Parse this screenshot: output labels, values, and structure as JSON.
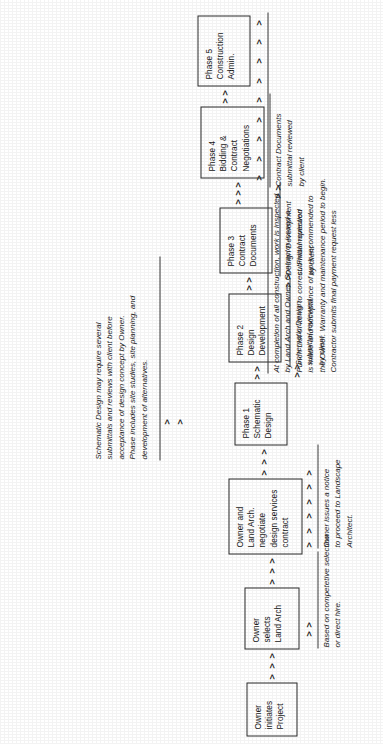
{
  "document": {
    "type": "process-flow-diagram",
    "subject": "Landscape Architecture Project Delivery Process",
    "orientation": "landscape content rotated 90 degrees counter-clockwise on a portrait page"
  },
  "boxes": [
    {
      "id": "owner-initiates",
      "lines": [
        "Owner",
        "initiates",
        "Project"
      ]
    },
    {
      "id": "owner-selects",
      "lines": [
        "Owner",
        "selects",
        "Land  Arch"
      ]
    },
    {
      "id": "negotiate",
      "lines": [
        "Owner and",
        "Land  Arch.",
        "negotiate",
        "design services",
        "contract"
      ]
    },
    {
      "id": "phase-1",
      "lines": [
        "Phase 1",
        "Schematic",
        "Design"
      ]
    },
    {
      "id": "phase-2",
      "lines": [
        "Phase 2",
        "Design",
        "Development"
      ]
    },
    {
      "id": "phase-3",
      "lines": [
        "Phase 3",
        "Contract",
        "Documents"
      ]
    },
    {
      "id": "phase-4",
      "lines": [
        "Phase 4",
        "Bidding &",
        "Contract",
        "Negotiations"
      ]
    },
    {
      "id": "phase-5",
      "lines": [
        "Phase 5",
        "Construction",
        "Admin."
      ]
    }
  ],
  "notes": {
    "schematic_detail": {
      "lines": [
        "Schematic Design may require several",
        "submittals and reviews with client before",
        "acceptance of design concept by Owner.",
        "Phase includes site studies, site planning, and",
        "development of alternatives."
      ]
    },
    "selection_basis": {
      "lines": [
        "Based on competetive selection",
        "or direct hire."
      ]
    },
    "notice_to_proceed": {
      "lines": [
        "Owner issues a notice",
        "to proceed to Landscape",
        "Architect."
      ]
    },
    "sd_review": {
      "lines": [
        "Schematic Design",
        "submittal reviewed",
        "by client"
      ]
    },
    "dd_review": {
      "lines": [
        "Design Development",
        "submittal reviewed",
        "by client"
      ]
    },
    "cd_review": {
      "lines": [
        "Contract Documents",
        "submittal reviewed",
        "by client"
      ]
    },
    "closeout": {
      "lines": [
        "At completion of all construction, work is inspected",
        "by Land  Arch  and Owner.  Contractor issued a",
        "Punch List of items to correct.  Final inspection",
        "is made and acceptance of work recommended to",
        "the Owner.  Warranty and maintenance period to begin.",
        "Contractor submits final payment request less"
      ]
    }
  },
  "arrows": {
    "glyph": ">",
    "runs": [
      {
        "id": "initiates-to-selects",
        "count": 3
      },
      {
        "id": "selects-to-negotiate",
        "count": 3
      },
      {
        "id": "negotiate-to-phase1",
        "count": 3
      },
      {
        "id": "phase1-to-phase2",
        "count": 2
      },
      {
        "id": "phase2-to-phase3",
        "count": 2
      },
      {
        "id": "phase3-to-phase4",
        "count": 3
      },
      {
        "id": "phase4-to-phase5",
        "count": 2
      },
      {
        "id": "selection-feedback",
        "count": 2
      },
      {
        "id": "notice-feedback",
        "count": 6
      },
      {
        "id": "sd-review-feedback",
        "count": 2
      },
      {
        "id": "dd-review-feedback",
        "count": 2
      },
      {
        "id": "cd-review-feedback",
        "count": 2
      },
      {
        "id": "closeout-feedback",
        "count": 9
      }
    ]
  },
  "colors": {
    "ink": "#1c1c1c",
    "box_border": "#2a2a2a",
    "rule": "#3a3a3a",
    "paper": "#ffffff"
  }
}
